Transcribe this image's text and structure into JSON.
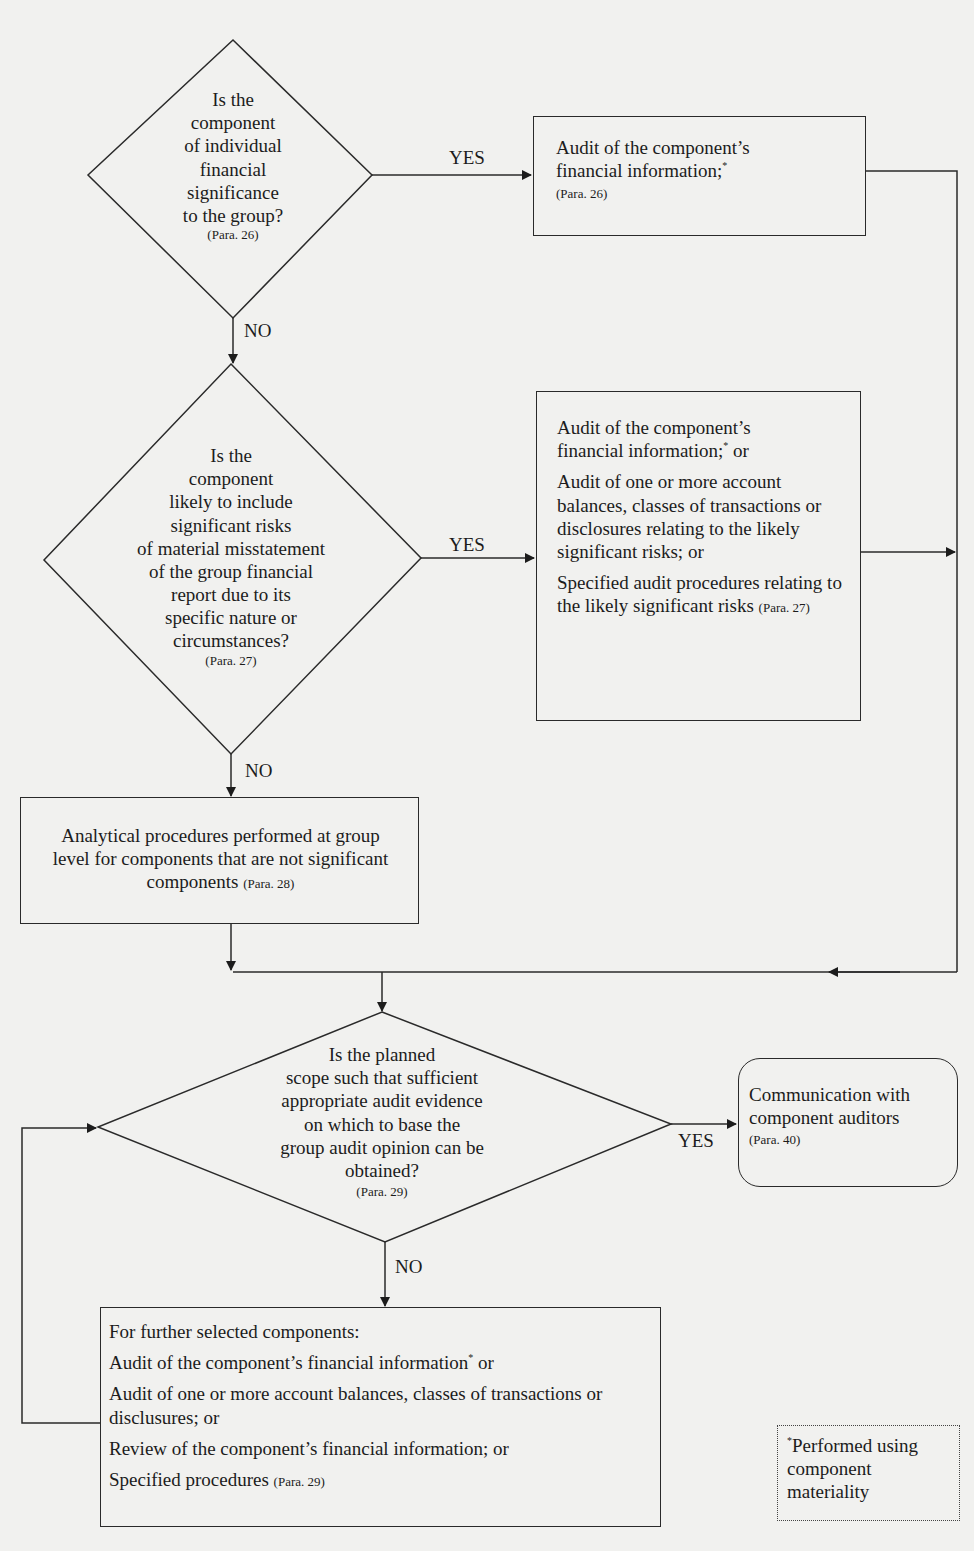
{
  "flowchart": {
    "decisions": [
      {
        "id": "d1",
        "lines": [
          "Is the",
          "component",
          "of individual",
          "financial",
          "significance",
          "to the group?"
        ],
        "para": "(Para. 26)"
      },
      {
        "id": "d2",
        "lines": [
          "Is the",
          "component",
          "likely to include",
          "significant risks",
          "of material misstatement",
          "of the group financial",
          "report due to its",
          "specific nature or",
          "circumstances?"
        ],
        "para": "(Para. 27)"
      },
      {
        "id": "d3",
        "lines": [
          "Is the planned",
          "scope such that sufficient",
          "appropriate audit evidence",
          "on which to base the",
          "group audit opinion can be",
          "obtained?"
        ],
        "para": "(Para. 29)"
      }
    ],
    "boxes": {
      "b1": {
        "line1": "Audit of the component’s",
        "line2": "financial information;",
        "mark": "*",
        "para": "(Para. 26)"
      },
      "b2": {
        "item1_line1": "Audit of the component’s",
        "item1_line2": "financial information;",
        "item1_mark": "*",
        "item1_tail": " or",
        "item2": "Audit of one or more account balances, classes of transactions or disclosures relating to the likely significant risks; or",
        "item3": "Specified audit procedures relating to the likely significant risks",
        "para": "(Para. 27)"
      },
      "b3": {
        "text": "Analytical procedures performed at group level for components that are not significant components",
        "para": "(Para. 28)"
      },
      "b4": {
        "text": "Communication with component auditors",
        "para": "(Para. 40)"
      },
      "b5": {
        "heading": "For further selected components:",
        "item1": "Audit of the component’s financial information",
        "item1_mark": "*",
        "item1_tail": " or",
        "item2": "Audit of one or more account balances, classes of transactions or disclusures; or",
        "item3": "Review of the component’s financial information; or",
        "item4": "Specified procedures",
        "para": "(Para. 29)"
      }
    },
    "labels": {
      "yes": "YES",
      "no": "NO"
    },
    "footnote": {
      "mark": "*",
      "text": "Performed using component materiality"
    }
  },
  "colors": {
    "background": "#f1f1ef",
    "ink": "#1c1c1c"
  }
}
